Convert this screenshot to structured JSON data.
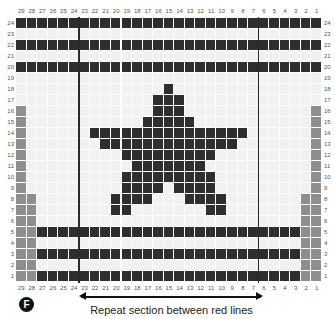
{
  "chart_data": {
    "type": "heatmap",
    "columns": [
      29,
      28,
      27,
      26,
      25,
      24,
      23,
      22,
      21,
      20,
      19,
      18,
      17,
      16,
      15,
      14,
      13,
      12,
      11,
      10,
      9,
      8,
      7,
      6,
      5,
      4,
      3,
      2,
      1
    ],
    "rows": [
      24,
      23,
      22,
      21,
      20,
      19,
      18,
      17,
      16,
      15,
      14,
      13,
      12,
      11,
      10,
      9,
      8,
      7,
      6,
      5,
      4,
      3,
      2,
      1
    ],
    "colors": {
      "dark": "#2e2e2e",
      "grey": "#8e8e8e",
      "light": "#f1f1f1",
      "repeat_line": "#2a2a2a"
    },
    "dark_cells": {
      "24": [
        29,
        28,
        27,
        26,
        25,
        24,
        23,
        22,
        21,
        20,
        19,
        18,
        17,
        16,
        15,
        14,
        13,
        12,
        11,
        10,
        9,
        8,
        7,
        6,
        5,
        4,
        3,
        2,
        1
      ],
      "22": [
        29,
        28,
        27,
        26,
        25,
        24,
        23,
        22,
        21,
        20,
        19,
        18,
        17,
        16,
        15,
        14,
        13,
        12,
        11,
        10,
        9,
        8,
        7,
        6,
        5,
        4,
        3,
        2,
        1
      ],
      "20": [
        29,
        28,
        27,
        26,
        25,
        24,
        23,
        22,
        21,
        20,
        19,
        18,
        17,
        16,
        15,
        14,
        13,
        12,
        11,
        10,
        9,
        8,
        7,
        6,
        5,
        4,
        3,
        2,
        1
      ],
      "18": [
        15
      ],
      "17": [
        16,
        15,
        14
      ],
      "16": [
        16,
        15,
        14
      ],
      "15": [
        17,
        16,
        15,
        14,
        13
      ],
      "14": [
        22,
        21,
        20,
        19,
        18,
        17,
        16,
        15,
        14,
        13,
        12,
        11,
        10,
        9,
        8
      ],
      "13": [
        21,
        20,
        19,
        18,
        17,
        16,
        15,
        14,
        13,
        12,
        11,
        10,
        9
      ],
      "12": [
        19,
        18,
        17,
        16,
        15,
        14,
        13,
        12,
        11
      ],
      "11": [
        18,
        17,
        16,
        15,
        14,
        13,
        12
      ],
      "10": [
        19,
        18,
        17,
        16,
        15,
        14,
        13,
        12,
        11
      ],
      "9": [
        19,
        18,
        17,
        16,
        14,
        13,
        12,
        11
      ],
      "8": [
        20,
        19,
        18,
        17,
        13,
        12,
        11,
        10
      ],
      "7": [
        20,
        19,
        11,
        10
      ],
      "5": [
        27,
        26,
        25,
        24,
        23,
        22,
        21,
        20,
        19,
        18,
        17,
        16,
        15,
        14,
        13,
        12,
        11,
        10,
        9,
        8,
        7,
        6,
        5,
        4,
        3
      ],
      "3": [
        27,
        26,
        25,
        24,
        23,
        22,
        21,
        20,
        19,
        18,
        17,
        16,
        15,
        14,
        13,
        12,
        11,
        10,
        9,
        8,
        7,
        6,
        5,
        4,
        3
      ],
      "1": [
        27,
        26,
        25,
        24,
        23,
        22,
        21,
        20,
        19,
        18,
        17,
        16,
        15,
        14,
        13,
        12,
        11,
        10,
        9,
        8,
        7,
        6,
        5,
        4,
        3
      ]
    },
    "grey_cells": {
      "16": [
        29,
        1
      ],
      "15": [
        29,
        1
      ],
      "14": [
        29,
        1
      ],
      "13": [
        29,
        1
      ],
      "12": [
        29,
        1
      ],
      "11": [
        29,
        1
      ],
      "10": [
        29,
        1
      ],
      "9": [
        29,
        1
      ],
      "8": [
        29,
        28,
        2,
        1
      ],
      "7": [
        29,
        28,
        2,
        1
      ],
      "6": [
        29,
        28,
        2,
        1
      ],
      "5": [
        29,
        28,
        2,
        1
      ],
      "4": [
        29,
        28,
        2,
        1
      ],
      "3": [
        29,
        28,
        2,
        1
      ],
      "2": [
        29,
        28,
        2,
        1
      ],
      "1": [
        29,
        28,
        2,
        1
      ]
    },
    "repeat_lines": {
      "left_between_cols": [
        24,
        23
      ],
      "right_between_cols": [
        7,
        6
      ]
    },
    "annotations": [
      "Repeat section between red lines"
    ]
  },
  "badge": {
    "label": "F"
  },
  "caption": {
    "text": "Repeat section between red lines"
  }
}
